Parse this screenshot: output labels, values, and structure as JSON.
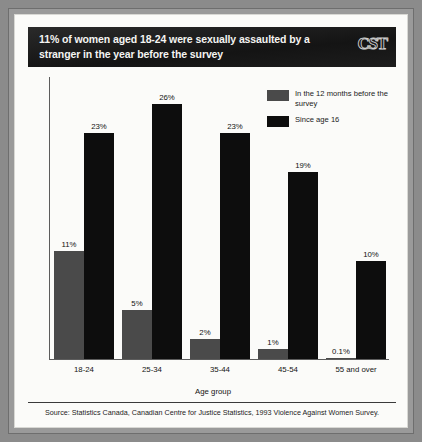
{
  "header": {
    "title": "11% of women aged 18-24 were sexually assaulted by a stranger in the year before the survey",
    "logo": "CST"
  },
  "legend": {
    "items": [
      {
        "label": "In the 12 months before the survey",
        "color": "#4a4a4a",
        "icon": "legend-swatch-gray"
      },
      {
        "label": "Since age 16",
        "color": "#0d0d0d",
        "icon": "legend-swatch-black"
      }
    ]
  },
  "source": {
    "text": "Source: Statistics Canada, Canadian Centre for Justice Statistics, 1993 Violence Against Women Survey."
  },
  "chart_data": {
    "type": "bar",
    "title": "11% of women aged 18-24 were sexually assaulted by a stranger in the year before the survey",
    "xlabel": "Age group",
    "ylabel": "",
    "ylim": [
      0,
      28
    ],
    "grid": false,
    "legend_position": "top-right",
    "categories": [
      "18-24",
      "25-34",
      "35-44",
      "45-54",
      "55 and over"
    ],
    "series": [
      {
        "name": "In the 12 months before the survey",
        "color": "#4a4a4a",
        "values": [
          11,
          5,
          2,
          1,
          0.1
        ],
        "labels": [
          "11%",
          "5%",
          "2%",
          "1%",
          "0.1%"
        ]
      },
      {
        "name": "Since age 16",
        "color": "#0d0d0d",
        "values": [
          23,
          26,
          23,
          19,
          10
        ],
        "labels": [
          "23%",
          "26%",
          "23%",
          "19%",
          "10%"
        ]
      }
    ]
  }
}
